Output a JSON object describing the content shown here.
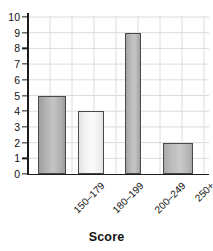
{
  "chart_data": {
    "type": "bar",
    "title": "",
    "title_fragment_visible": true,
    "categories": [
      "150–179",
      "180–199",
      "200–249",
      "250+"
    ],
    "values": [
      5,
      4,
      9,
      2
    ],
    "series": [
      {
        "name": "Frequency",
        "values": [
          5,
          4,
          9,
          2
        ]
      }
    ],
    "xlabel": "Score",
    "ylabel": "",
    "ylim": [
      0,
      10
    ],
    "ytick_labels": [
      "0",
      "1",
      "2",
      "3",
      "4",
      "5",
      "6",
      "7",
      "8",
      "9",
      "10"
    ],
    "ytick_values": [
      0,
      1,
      2,
      3,
      4,
      5,
      6,
      7,
      8,
      9,
      10
    ],
    "grid": "both",
    "legend": "none",
    "bar_colors": [
      "#b3b3b3",
      "#f2f2f2",
      "#b5b5b5",
      "#bdbdbd"
    ],
    "bar_edge_color": "#4a4a4a",
    "grid_color": "#d9d9d9",
    "axis_color": "#1c1c1c"
  },
  "axis": {
    "x_title": "Score"
  }
}
